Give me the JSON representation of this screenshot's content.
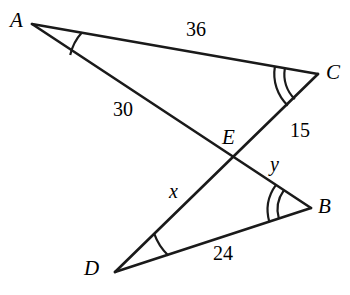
{
  "figure": {
    "kind": "geometry-diagram",
    "stroke_color": "#1a1a1a",
    "background_color": "#ffffff",
    "width": 350,
    "height": 295
  },
  "vertices": [
    {
      "id": "A",
      "label": "A",
      "x": 32,
      "y": 24,
      "label_x": 10,
      "label_y": 10
    },
    {
      "id": "C",
      "label": "C",
      "x": 318,
      "y": 74,
      "label_x": 326,
      "label_y": 62
    },
    {
      "id": "E",
      "label": "E",
      "x": 233,
      "y": 163,
      "label_x": 222,
      "label_y": 127
    },
    {
      "id": "B",
      "label": "B",
      "x": 311,
      "y": 208,
      "label_x": 318,
      "label_y": 196
    },
    {
      "id": "D",
      "label": "D",
      "x": 115,
      "y": 272,
      "label_x": 84,
      "label_y": 258
    }
  ],
  "segments": [
    {
      "id": "AC",
      "from": "A",
      "to": "C"
    },
    {
      "id": "AB",
      "from": "A",
      "to": "B"
    },
    {
      "id": "CD",
      "from": "C",
      "to": "D"
    },
    {
      "id": "DB",
      "from": "D",
      "to": "B"
    }
  ],
  "measures": [
    {
      "id": "AC",
      "text": "36",
      "x": 186,
      "y": 19,
      "type": "number"
    },
    {
      "id": "AE",
      "text": "30",
      "x": 113,
      "y": 99,
      "type": "number"
    },
    {
      "id": "CE",
      "text": "15",
      "x": 290,
      "y": 120,
      "type": "number"
    },
    {
      "id": "ED",
      "text": "x",
      "x": 169,
      "y": 181,
      "type": "variable"
    },
    {
      "id": "EB",
      "text": "y",
      "x": 270,
      "y": 154,
      "type": "variable"
    },
    {
      "id": "DB",
      "text": "24",
      "x": 213,
      "y": 243,
      "type": "number"
    }
  ],
  "angle_marks": [
    {
      "at": "A",
      "arcs": 1
    },
    {
      "at": "C",
      "arcs": 2
    },
    {
      "at": "B",
      "arcs": 2
    },
    {
      "at": "D",
      "arcs": 1
    }
  ]
}
